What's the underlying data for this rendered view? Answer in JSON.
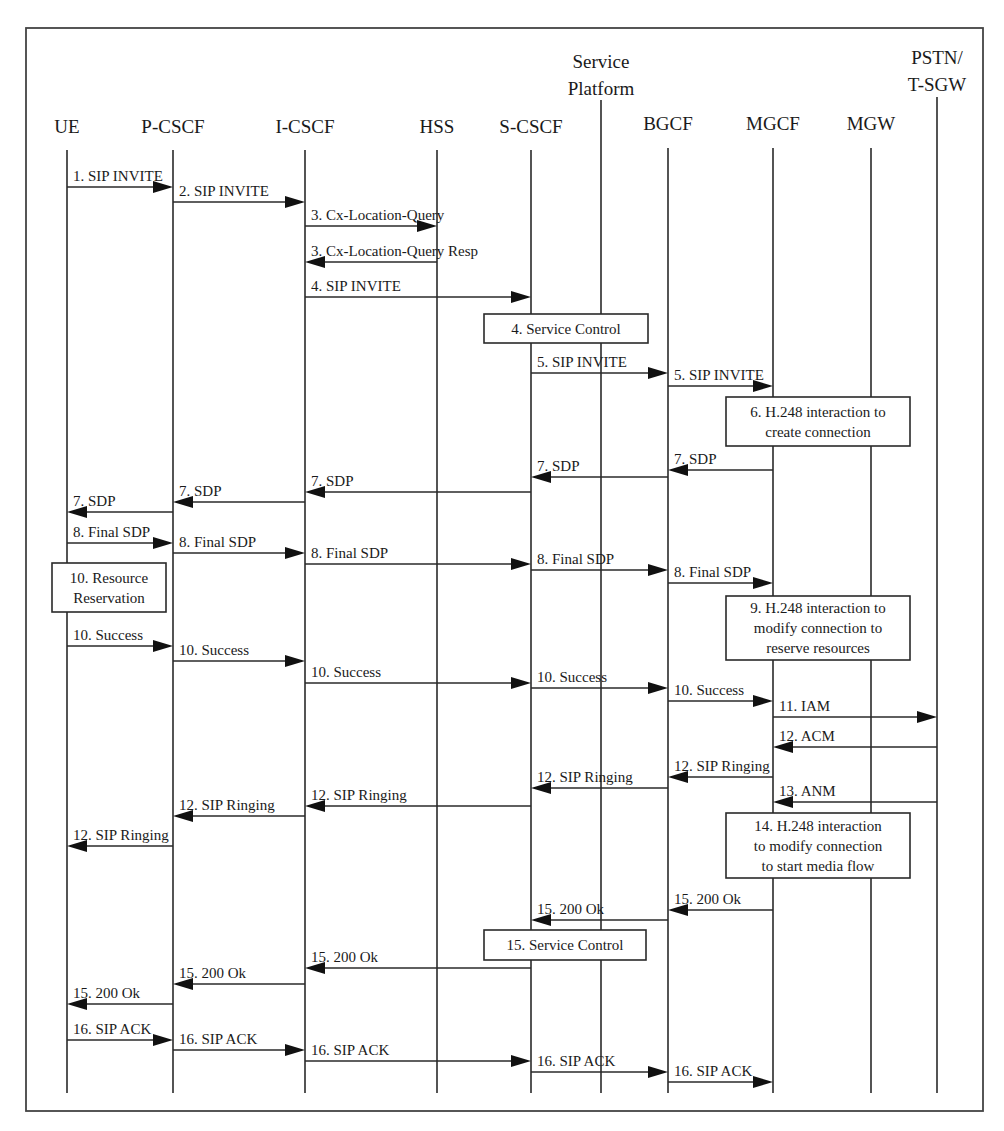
{
  "diagram": {
    "type": "sequence",
    "frame": {
      "x": 26,
      "y": 28,
      "w": 957,
      "h": 1083
    },
    "participants": [
      {
        "id": "UE",
        "lines": [
          "UE"
        ],
        "x": 67,
        "label_y": 133,
        "top": 150,
        "bottom": 1093
      },
      {
        "id": "P-CSCF",
        "lines": [
          "P-CSCF"
        ],
        "x": 173,
        "label_y": 133,
        "top": 150,
        "bottom": 1093
      },
      {
        "id": "I-CSCF",
        "lines": [
          "I-CSCF"
        ],
        "x": 305,
        "label_y": 133,
        "top": 150,
        "bottom": 1093
      },
      {
        "id": "HSS",
        "lines": [
          "HSS"
        ],
        "x": 437,
        "label_y": 133,
        "top": 150,
        "bottom": 1093
      },
      {
        "id": "S-CSCF",
        "lines": [
          "S-CSCF"
        ],
        "x": 531,
        "label_y": 133,
        "top": 150,
        "bottom": 1093
      },
      {
        "id": "SP",
        "lines": [
          "Service",
          "Platform"
        ],
        "x": 601,
        "label_y": 68,
        "top": 100,
        "bottom": 1093
      },
      {
        "id": "BGCF",
        "lines": [
          "BGCF"
        ],
        "x": 668,
        "label_y": 130,
        "top": 148,
        "bottom": 1093
      },
      {
        "id": "MGCF",
        "lines": [
          "MGCF"
        ],
        "x": 773,
        "label_y": 130,
        "top": 148,
        "bottom": 1093
      },
      {
        "id": "MGW",
        "lines": [
          "MGW"
        ],
        "x": 871,
        "label_y": 130,
        "top": 148,
        "bottom": 1093
      },
      {
        "id": "PSTN",
        "lines": [
          "PSTN/",
          "T-SGW"
        ],
        "x": 937,
        "label_y": 64,
        "top": 97,
        "bottom": 1093
      }
    ],
    "messages": [
      {
        "label": "1. SIP INVITE",
        "from": "UE",
        "to": "P-CSCF",
        "y": 187
      },
      {
        "label": "2. SIP INVITE",
        "from": "P-CSCF",
        "to": "I-CSCF",
        "y": 202
      },
      {
        "label": "3. Cx-Location-Query",
        "from": "I-CSCF",
        "to": "HSS",
        "y": 226
      },
      {
        "label": "3. Cx-Location-Query Resp",
        "from": "HSS",
        "to": "I-CSCF",
        "y": 262
      },
      {
        "label": "4. SIP INVITE",
        "from": "I-CSCF",
        "to": "S-CSCF",
        "y": 297
      },
      {
        "label": "5. SIP INVITE",
        "from": "S-CSCF",
        "to": "BGCF",
        "y": 373
      },
      {
        "label": "5. SIP INVITE",
        "from": "BGCF",
        "to": "MGCF",
        "y": 386
      },
      {
        "label": "7. SDP",
        "from": "MGCF",
        "to": "BGCF",
        "y": 470
      },
      {
        "label": "7. SDP",
        "from": "BGCF",
        "to": "S-CSCF",
        "y": 477
      },
      {
        "label": "7. SDP",
        "from": "S-CSCF",
        "to": "I-CSCF",
        "y": 492
      },
      {
        "label": "7. SDP",
        "from": "I-CSCF",
        "to": "P-CSCF",
        "y": 502
      },
      {
        "label": "7. SDP",
        "from": "P-CSCF",
        "to": "UE",
        "y": 512
      },
      {
        "label": "8. Final SDP",
        "from": "UE",
        "to": "P-CSCF",
        "y": 543
      },
      {
        "label": "8. Final SDP",
        "from": "P-CSCF",
        "to": "I-CSCF",
        "y": 553
      },
      {
        "label": "8. Final SDP",
        "from": "I-CSCF",
        "to": "S-CSCF",
        "y": 564
      },
      {
        "label": "8. Final SDP",
        "from": "S-CSCF",
        "to": "BGCF",
        "y": 570
      },
      {
        "label": "8. Final SDP",
        "from": "BGCF",
        "to": "MGCF",
        "y": 583
      },
      {
        "label": "10. Success",
        "from": "UE",
        "to": "P-CSCF",
        "y": 646
      },
      {
        "label": "10. Success",
        "from": "P-CSCF",
        "to": "I-CSCF",
        "y": 661
      },
      {
        "label": "10. Success",
        "from": "I-CSCF",
        "to": "S-CSCF",
        "y": 683
      },
      {
        "label": "10. Success",
        "from": "S-CSCF",
        "to": "BGCF",
        "y": 688
      },
      {
        "label": "10. Success",
        "from": "BGCF",
        "to": "MGCF",
        "y": 701
      },
      {
        "label": "11. IAM",
        "from": "MGCF",
        "to": "PSTN",
        "y": 717
      },
      {
        "label": "12. ACM",
        "from": "PSTN",
        "to": "MGCF",
        "y": 747
      },
      {
        "label": "12. SIP Ringing",
        "from": "MGCF",
        "to": "BGCF",
        "y": 777
      },
      {
        "label": "12. SIP Ringing",
        "from": "BGCF",
        "to": "S-CSCF",
        "y": 788
      },
      {
        "label": "13. ANM",
        "from": "PSTN",
        "to": "MGCF",
        "y": 802
      },
      {
        "label": "12. SIP Ringing",
        "from": "S-CSCF",
        "to": "I-CSCF",
        "y": 806
      },
      {
        "label": "12. SIP Ringing",
        "from": "I-CSCF",
        "to": "P-CSCF",
        "y": 816
      },
      {
        "label": "12. SIP Ringing",
        "from": "P-CSCF",
        "to": "UE",
        "y": 846
      },
      {
        "label": "15. 200 Ok",
        "from": "MGCF",
        "to": "BGCF",
        "y": 910
      },
      {
        "label": "15. 200 Ok",
        "from": "BGCF",
        "to": "S-CSCF",
        "y": 920
      },
      {
        "label": "15. 200 Ok",
        "from": "S-CSCF",
        "to": "I-CSCF",
        "y": 968
      },
      {
        "label": "15. 200 Ok",
        "from": "I-CSCF",
        "to": "P-CSCF",
        "y": 984
      },
      {
        "label": "15. 200 Ok",
        "from": "P-CSCF",
        "to": "UE",
        "y": 1004
      },
      {
        "label": "16. SIP ACK",
        "from": "UE",
        "to": "P-CSCF",
        "y": 1040
      },
      {
        "label": "16. SIP ACK",
        "from": "P-CSCF",
        "to": "I-CSCF",
        "y": 1050
      },
      {
        "label": "16. SIP ACK",
        "from": "I-CSCF",
        "to": "S-CSCF",
        "y": 1061
      },
      {
        "label": "16. SIP ACK",
        "from": "S-CSCF",
        "to": "BGCF",
        "y": 1072
      },
      {
        "label": "16. SIP ACK",
        "from": "BGCF",
        "to": "MGCF",
        "y": 1082
      }
    ],
    "boxes": [
      {
        "lines": [
          "4. Service Control"
        ],
        "x": 484,
        "y": 314,
        "w": 164,
        "h": 29
      },
      {
        "lines": [
          "6. H.248 interaction to",
          "create connection"
        ],
        "x": 726,
        "y": 397,
        "w": 184,
        "h": 49
      },
      {
        "lines": [
          "10. Resource",
          "Reservation"
        ],
        "x": 52,
        "y": 563,
        "w": 114,
        "h": 49
      },
      {
        "lines": [
          "9. H.248 interaction to",
          "modify connection to",
          "reserve resources"
        ],
        "x": 726,
        "y": 596,
        "w": 184,
        "h": 64
      },
      {
        "lines": [
          "14. H.248 interaction",
          "to modify connection",
          "to start media flow"
        ],
        "x": 726,
        "y": 813,
        "w": 184,
        "h": 65
      },
      {
        "lines": [
          "15. Service Control"
        ],
        "x": 484,
        "y": 930,
        "w": 162,
        "h": 30
      }
    ]
  }
}
